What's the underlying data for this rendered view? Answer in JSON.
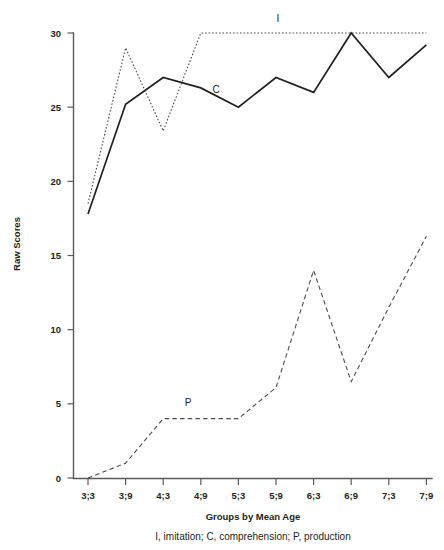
{
  "chart_data": {
    "type": "line",
    "title": "",
    "xlabel": "Groups by Mean Age",
    "ylabel": "Raw Scores",
    "categories": [
      "3;3",
      "3;9",
      "4;3",
      "4;9",
      "5;3",
      "5;9",
      "6;3",
      "6;9",
      "7;3",
      "7;9"
    ],
    "ylim": [
      0,
      30
    ],
    "yticks": [
      0,
      5,
      10,
      15,
      20,
      25,
      30
    ],
    "ytick_labels": [
      "0",
      "5",
      "10",
      "15",
      "20",
      "25",
      "30"
    ],
    "grid": false,
    "legend_position": "inline-labels",
    "caption": "I, imitation; C, comprehension; P, production",
    "series": [
      {
        "name": "I",
        "label": "I",
        "description": "imitation",
        "style": "dotted",
        "values": [
          18.5,
          29.0,
          23.4,
          30.0,
          30.0,
          30.0,
          30.0,
          30.0,
          30.0,
          30.0
        ]
      },
      {
        "name": "C",
        "label": "C",
        "description": "comprehension",
        "style": "solid",
        "values": [
          17.8,
          25.2,
          27.0,
          26.3,
          25.0,
          27.0,
          26.0,
          30.0,
          27.0,
          29.2
        ]
      },
      {
        "name": "P",
        "label": "P",
        "description": "production",
        "style": "dashed",
        "values": [
          0.0,
          1.0,
          4.0,
          4.0,
          4.0,
          6.1,
          14.0,
          6.5,
          11.5,
          16.3
        ]
      }
    ],
    "series_label_positions": [
      {
        "name": "I",
        "x": 278,
        "y": 22
      },
      {
        "name": "C",
        "x": 216,
        "y": 93
      },
      {
        "name": "P",
        "x": 188,
        "y": 406
      }
    ]
  }
}
